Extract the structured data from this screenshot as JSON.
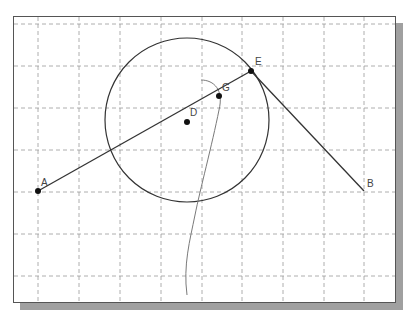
{
  "diagram": {
    "frame": {
      "x": 13,
      "y": 16,
      "width": 381,
      "height": 285
    },
    "grid": {
      "vertical_x": [
        38,
        79,
        120,
        161,
        202,
        242,
        283,
        324,
        364
      ],
      "horizontal_y": [
        24,
        66,
        108,
        150,
        192,
        234,
        276
      ],
      "color": "#9a9a9a"
    },
    "circle": {
      "cx": 187,
      "cy": 120,
      "r": 82
    },
    "points": [
      {
        "name": "A",
        "x": 38,
        "y": 191,
        "dot": true,
        "label_dx": 3,
        "label_dy": -5
      },
      {
        "name": "D",
        "x": 187,
        "y": 122,
        "dot": true,
        "label_dx": 3,
        "label_dy": -6
      },
      {
        "name": "G",
        "x": 219,
        "y": 96,
        "dot": true,
        "label_dx": 3,
        "label_dy": -5
      },
      {
        "name": "E",
        "x": 251,
        "y": 71,
        "dot": true,
        "label_dx": 4,
        "label_dy": -6
      },
      {
        "name": "B",
        "x": 364,
        "y": 191,
        "dot": false,
        "label_dx": 3,
        "label_dy": -4
      }
    ],
    "segments": [
      {
        "from": "A",
        "to": "E"
      },
      {
        "from": "E",
        "to": "B"
      }
    ],
    "curve_path": "M 201 80 C 214 80 224 90 219 110 C 212 145 200 190 195 215 C 190 240 183 265 187 295",
    "colors": {
      "line": "#333333",
      "curve": "#7a7a7a",
      "frame": "#555555",
      "shadow": "#a0a0a0"
    }
  }
}
